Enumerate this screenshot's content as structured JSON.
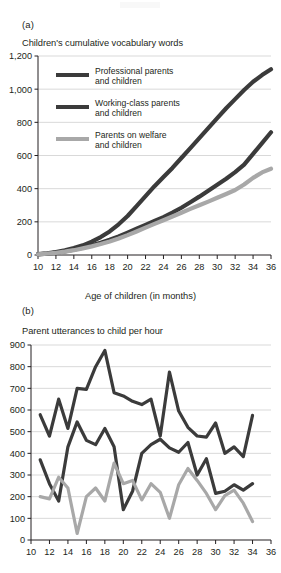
{
  "figure": {
    "background": "#ffffff",
    "text_color": "#231f20"
  },
  "colors": {
    "professional": "#3b3b3b",
    "working_class": "#3b3b3b",
    "welfare": "#a8a8a8",
    "gridline": "#c9c9c9",
    "axis": "#231f20"
  },
  "panel_a": {
    "letter": "(a)",
    "title": "Children's cumulative vocabulary words",
    "xaxis_title": "Age of children (in months)",
    "legend": [
      {
        "label_line1": "Professional parents",
        "label_line2": "and children",
        "color": "#3b3b3b"
      },
      {
        "label_line1": "Working-class parents",
        "label_line2": "and children",
        "color": "#3b3b3b"
      },
      {
        "label_line1": "Parents on welfare",
        "label_line2": "and children",
        "color": "#a8a8a8"
      }
    ]
  },
  "panel_b": {
    "letter": "(b)",
    "title": "Parent utterances to child per hour"
  },
  "chart_data": [
    {
      "id": "panel-a",
      "type": "line",
      "title": "Children's cumulative vocabulary words",
      "xlabel": "Age of children (in months)",
      "ylabel": "",
      "xlim": [
        10,
        36
      ],
      "ylim": [
        0,
        1200
      ],
      "xticks": [
        10,
        12,
        14,
        16,
        18,
        20,
        22,
        24,
        26,
        28,
        30,
        32,
        34,
        36
      ],
      "xtick_labels": [
        "10",
        "12",
        "14",
        "16",
        "18",
        "20",
        "22",
        "24",
        "26",
        "28",
        "30",
        "32",
        "34",
        "36"
      ],
      "yticks": [
        0,
        200,
        400,
        600,
        800,
        1000,
        1200
      ],
      "ytick_labels": [
        "0",
        "200",
        "400",
        "600",
        "800",
        "1,000",
        "1,200"
      ],
      "grid": "horizontal",
      "legend_position": "inside-upper-left",
      "x": [
        10,
        11,
        12,
        13,
        14,
        15,
        16,
        17,
        18,
        19,
        20,
        21,
        22,
        23,
        24,
        25,
        26,
        27,
        28,
        29,
        30,
        31,
        32,
        33,
        34,
        35,
        36
      ],
      "series": [
        {
          "name": "Professional parents and children",
          "color": "#3b3b3b",
          "values": [
            5,
            10,
            18,
            28,
            42,
            58,
            80,
            108,
            142,
            185,
            235,
            295,
            355,
            415,
            470,
            525,
            585,
            645,
            705,
            765,
            825,
            885,
            940,
            995,
            1045,
            1085,
            1120
          ]
        },
        {
          "name": "Working-class parents and children",
          "color": "#3b3b3b",
          "values": [
            4,
            8,
            14,
            22,
            32,
            44,
            58,
            74,
            92,
            112,
            135,
            158,
            182,
            205,
            228,
            255,
            285,
            318,
            352,
            388,
            424,
            460,
            500,
            545,
            610,
            675,
            740
          ]
        },
        {
          "name": "Parents on welfare and children",
          "color": "#a8a8a8",
          "values": [
            4,
            8,
            13,
            20,
            29,
            40,
            52,
            66,
            82,
            100,
            120,
            142,
            165,
            188,
            210,
            232,
            255,
            278,
            300,
            322,
            345,
            368,
            392,
            425,
            465,
            498,
            520
          ]
        }
      ]
    },
    {
      "id": "panel-b",
      "type": "line",
      "title": "Parent utterances to child per hour",
      "xlabel": "",
      "ylabel": "",
      "xlim": [
        10,
        36
      ],
      "ylim": [
        0,
        900
      ],
      "xticks": [
        10,
        12,
        14,
        16,
        18,
        20,
        22,
        24,
        26,
        28,
        30,
        32,
        34,
        36
      ],
      "xtick_labels": [
        "10",
        "12",
        "14",
        "16",
        "18",
        "20",
        "22",
        "24",
        "26",
        "28",
        "30",
        "32",
        "34",
        "36"
      ],
      "yticks": [
        0,
        100,
        200,
        300,
        400,
        500,
        600,
        700,
        800,
        900
      ],
      "ytick_labels": [
        "0",
        "100",
        "200",
        "300",
        "400",
        "500",
        "600",
        "700",
        "800",
        "900"
      ],
      "grid": "horizontal",
      "legend_position": "none",
      "x": [
        11,
        12,
        13,
        14,
        15,
        16,
        17,
        18,
        19,
        20,
        21,
        22,
        23,
        24,
        25,
        26,
        27,
        28,
        29,
        30,
        31,
        32,
        33,
        34
      ],
      "series": [
        {
          "name": "Professional parents and children",
          "color": "#3b3b3b",
          "values": [
            578,
            480,
            650,
            515,
            700,
            695,
            800,
            875,
            680,
            665,
            640,
            625,
            650,
            480,
            775,
            595,
            520,
            480,
            475,
            540,
            400,
            430,
            385,
            575
          ]
        },
        {
          "name": "Working-class parents and children",
          "color": "#3b3b3b",
          "values": [
            370,
            260,
            180,
            430,
            545,
            460,
            440,
            515,
            430,
            140,
            225,
            400,
            440,
            465,
            425,
            405,
            450,
            300,
            375,
            215,
            225,
            255,
            230,
            260
          ]
        },
        {
          "name": "Parents on welfare and children",
          "color": "#a8a8a8",
          "values": [
            200,
            190,
            290,
            240,
            30,
            200,
            240,
            180,
            355,
            260,
            275,
            185,
            260,
            220,
            100,
            255,
            330,
            275,
            215,
            140,
            205,
            230,
            170,
            85
          ]
        }
      ]
    }
  ]
}
